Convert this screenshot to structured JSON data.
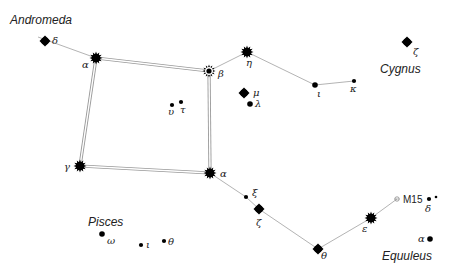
{
  "constellations": [
    {
      "name": "Andromeda",
      "x": 10,
      "y": 24
    },
    {
      "name": "Cygnus",
      "x": 380,
      "y": 73
    },
    {
      "name": "Pisces",
      "x": 88,
      "y": 226
    },
    {
      "name": "Equuleus",
      "x": 382,
      "y": 260
    }
  ],
  "stars": [
    {
      "id": "and-delta",
      "label": "δ",
      "x": 45,
      "y": 41,
      "size": "medium",
      "lx": 52,
      "ly": 44
    },
    {
      "id": "alpheratz",
      "label": "α",
      "x": 96,
      "y": 58,
      "size": "large",
      "lx": 82,
      "ly": 68
    },
    {
      "id": "scheat",
      "label": "β",
      "x": 209,
      "y": 71,
      "size": "large-ring",
      "lx": 218,
      "ly": 77
    },
    {
      "id": "eta",
      "label": "η",
      "x": 247,
      "y": 52,
      "size": "large",
      "lx": 246,
      "ly": 66
    },
    {
      "id": "iota",
      "label": "ι",
      "x": 315,
      "y": 85,
      "size": "small",
      "lx": 317,
      "ly": 97
    },
    {
      "id": "kappa",
      "label": "κ",
      "x": 354,
      "y": 81,
      "size": "tiny",
      "lx": 350,
      "ly": 92
    },
    {
      "id": "cyg-zeta",
      "label": "ζ",
      "x": 407,
      "y": 42,
      "size": "medium",
      "lx": 413,
      "ly": 55
    },
    {
      "id": "mu",
      "label": "μ",
      "x": 244,
      "y": 93,
      "size": "medium",
      "lx": 253,
      "ly": 96
    },
    {
      "id": "lambda",
      "label": "λ",
      "x": 250,
      "y": 104,
      "size": "small",
      "lx": 255,
      "ly": 107
    },
    {
      "id": "upsilon",
      "label": "υ",
      "x": 172,
      "y": 105,
      "size": "tiny",
      "lx": 168,
      "ly": 115
    },
    {
      "id": "tau",
      "label": "τ",
      "x": 181,
      "y": 102,
      "size": "tiny",
      "lx": 180,
      "ly": 113
    },
    {
      "id": "algenib",
      "label": "γ",
      "x": 80,
      "y": 166,
      "size": "large",
      "lx": 64,
      "ly": 170
    },
    {
      "id": "markab",
      "label": "α",
      "x": 210,
      "y": 173,
      "size": "large",
      "lx": 220,
      "ly": 177
    },
    {
      "id": "xi",
      "label": "ξ",
      "x": 246,
      "y": 197,
      "size": "tiny",
      "lx": 252,
      "ly": 196
    },
    {
      "id": "zeta",
      "label": "ζ",
      "x": 259,
      "y": 209,
      "size": "medium",
      "lx": 256,
      "ly": 226
    },
    {
      "id": "theta",
      "label": "θ",
      "x": 318,
      "y": 249,
      "size": "medium",
      "lx": 321,
      "ly": 259
    },
    {
      "id": "epsilon",
      "label": "ε",
      "x": 371,
      "y": 218,
      "size": "large",
      "lx": 362,
      "ly": 232
    },
    {
      "id": "psc-omega",
      "label": "ω",
      "x": 102,
      "y": 234,
      "size": "small",
      "lx": 107,
      "ly": 244
    },
    {
      "id": "psc-iota",
      "label": "ι",
      "x": 141,
      "y": 245,
      "size": "tiny",
      "lx": 146,
      "ly": 248
    },
    {
      "id": "psc-theta",
      "label": "θ",
      "x": 164,
      "y": 241,
      "size": "tiny",
      "lx": 168,
      "ly": 245
    },
    {
      "id": "equ-delta",
      "label": "δ",
      "x": 429,
      "y": 199,
      "size": "tiny",
      "lx": 425,
      "ly": 212
    },
    {
      "id": "equ-delta2",
      "label": "",
      "x": 436,
      "y": 197,
      "size": "dot",
      "lx": 0,
      "ly": 0
    },
    {
      "id": "equ-alpha",
      "label": "α",
      "x": 430,
      "y": 239,
      "size": "small",
      "lx": 418,
      "ly": 242
    }
  ],
  "cluster": {
    "label": "M15",
    "x": 397,
    "y": 199,
    "lx": 403,
    "ly": 203
  },
  "square_lines": [
    [
      96,
      58,
      209,
      71
    ],
    [
      209,
      71,
      210,
      173
    ],
    [
      210,
      173,
      80,
      166
    ],
    [
      80,
      166,
      96,
      58
    ]
  ],
  "thin_lines": [
    [
      38,
      37,
      96,
      58
    ],
    [
      209,
      71,
      247,
      52
    ],
    [
      247,
      52,
      315,
      85
    ],
    [
      315,
      85,
      354,
      81
    ],
    [
      210,
      173,
      246,
      197
    ],
    [
      246,
      197,
      259,
      209
    ],
    [
      259,
      209,
      318,
      249
    ],
    [
      318,
      249,
      371,
      218
    ],
    [
      371,
      218,
      397,
      199
    ]
  ],
  "colors": {
    "star": "#000000",
    "line": "#aaaaaa",
    "text": "#222222"
  }
}
